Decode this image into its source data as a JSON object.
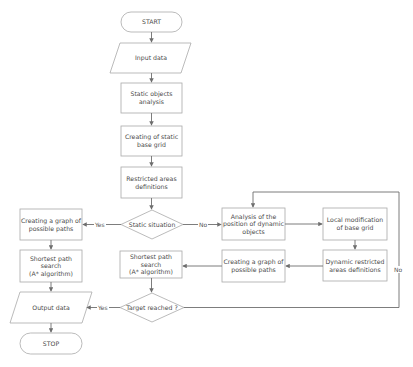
{
  "diagram": {
    "type": "flowchart",
    "colors": {
      "line": "#6e6e6e",
      "border": "#a9a9a9",
      "text": "#4a4a4a",
      "background": "#ffffff"
    },
    "nodes": {
      "start": {
        "label": "START",
        "shape": "terminator"
      },
      "input": {
        "label": "Input data",
        "shape": "parallelogram"
      },
      "static_analysis": {
        "label": "Static objects\nanalysis",
        "shape": "process"
      },
      "static_grid": {
        "label": "Creating of static\nbase grid",
        "shape": "process"
      },
      "restricted": {
        "label": "Restricted areas\ndefinitions",
        "shape": "process"
      },
      "static_decision": {
        "label": "Static situation",
        "shape": "decision"
      },
      "graph_left": {
        "label": "Creating a graph of\npossible paths",
        "shape": "process"
      },
      "shortest_left": {
        "label": "Shortest path\nsearch\n(A* algorithm)",
        "shape": "process"
      },
      "output": {
        "label": "Output data",
        "shape": "parallelogram"
      },
      "stop": {
        "label": "STOP",
        "shape": "terminator"
      },
      "dynamic_analysis": {
        "label": "Analysis of the\nposition of dynamic\nobjects",
        "shape": "process"
      },
      "local_mod": {
        "label": "Local modification\nof base grid",
        "shape": "process"
      },
      "dynamic_restricted": {
        "label": "Dynamic restricted\nareas definitions",
        "shape": "process"
      },
      "graph_mid": {
        "label": "Creating a graph of\npossible paths",
        "shape": "process"
      },
      "shortest_mid": {
        "label": "Shortest path\nsearch\n(A* algorithm)",
        "shape": "process"
      },
      "target_decision": {
        "label": "Target reached ?",
        "shape": "decision"
      }
    },
    "edge_labels": {
      "static_yes": "Yes",
      "static_no": "No",
      "target_yes": "Yes",
      "target_no": "No"
    }
  }
}
